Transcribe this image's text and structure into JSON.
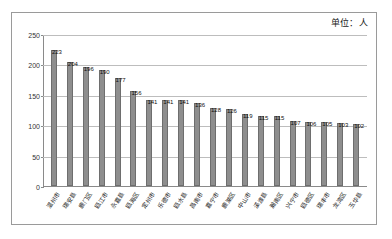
{
  "chart_data": {
    "type": "bar",
    "title": "",
    "unit_note": "单位：人",
    "xlabel": "",
    "ylabel": "",
    "ylim": [
      0,
      250
    ],
    "yticks": [
      0,
      50,
      100,
      150,
      200,
      250
    ],
    "grid": true,
    "legend": "none",
    "bar_color": "#8e8e8e",
    "categories": [
      "温州市",
      "瑞安县",
      "鹿门区",
      "瓯江市",
      "永嘉县",
      "瓯海区",
      "定州市",
      "乐德市",
      "瓯水县",
      "昌南市",
      "嘉宁市",
      "鹿湖区",
      "中山市",
      "溪渡县",
      "瀚南区",
      "兴宁市",
      "瓯德区",
      "瑞丰市",
      "龙湾区",
      "玉华县"
    ],
    "values": [
      223,
      204,
      196,
      190,
      177,
      156,
      141,
      141,
      141,
      136,
      128,
      126,
      119,
      115,
      115,
      107,
      106,
      105,
      103,
      102
    ],
    "data_labels": [
      "223",
      "204",
      "196",
      "190",
      "177",
      "156",
      "141",
      "141",
      "141",
      "136",
      "128",
      "126",
      "119",
      "115",
      "115",
      "107",
      "106",
      "105",
      "103",
      "102"
    ]
  }
}
